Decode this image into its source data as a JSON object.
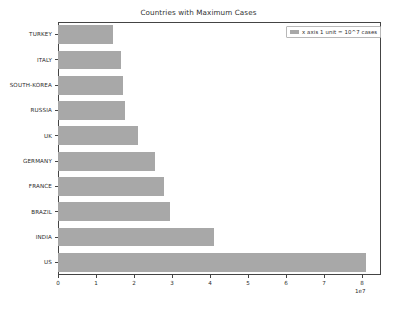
{
  "chart_data": {
    "type": "bar",
    "orientation": "horizontal",
    "title": "Countries with Maximum Cases",
    "xlabel": "",
    "ylabel": "",
    "categories": [
      "TURKEY",
      "ITALY",
      "SOUTH-KOREA",
      "RUSSIA",
      "UK",
      "GERMANY",
      "FRANCE",
      "BRAZIL",
      "INDIA",
      "US"
    ],
    "values": [
      14500000,
      16500000,
      17000000,
      17500000,
      21000000,
      25500000,
      28000000,
      29500000,
      41000000,
      81000000
    ],
    "values_scaled": [
      1.45,
      1.65,
      1.7,
      1.75,
      2.1,
      2.55,
      2.8,
      2.95,
      4.1,
      8.1
    ],
    "xlim": [
      0,
      85000000
    ],
    "x_tick_labels": [
      "0",
      "1",
      "2",
      "3",
      "4",
      "5",
      "6",
      "7",
      "8"
    ],
    "x_tick_values": [
      0,
      10000000,
      20000000,
      30000000,
      40000000,
      50000000,
      60000000,
      70000000,
      80000000
    ],
    "x_offset_text": "1e7",
    "grid": false,
    "bar_color": "#a8a8a8",
    "legend": {
      "position": "upper right",
      "entries": [
        {
          "label": "x axis 1 unit = 10^7 cases",
          "color": "#a8a8a8"
        }
      ]
    }
  },
  "figure": {
    "background": "#ffffff",
    "axes_edge_color": "#444444"
  }
}
